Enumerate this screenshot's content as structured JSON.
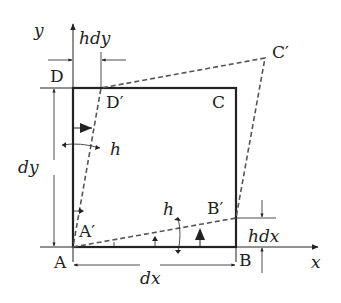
{
  "diagram": {
    "axes": {
      "x_label": "x",
      "y_label": "y"
    },
    "points": {
      "A": "A",
      "B": "B",
      "C": "C",
      "D": "D",
      "A_prime": "A′",
      "B_prime": "B′",
      "C_prime": "C′",
      "D_prime": "D′"
    },
    "dimensions": {
      "width": "dx",
      "height": "dy",
      "top_offset": "hdy",
      "right_offset": "hdx"
    },
    "angles": {
      "left_angle": "h",
      "bottom_angle": "h"
    },
    "colors": {
      "ink": "#222222",
      "dashed": "#555555"
    }
  }
}
